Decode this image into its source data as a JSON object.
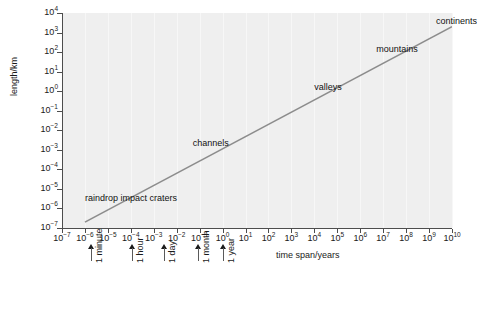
{
  "chart_data": {
    "type": "line",
    "title": "",
    "xlabel": "time span/years",
    "ylabel": "length/km",
    "xscale": "log",
    "yscale": "log",
    "xlim": [
      1e-07,
      10000000000.0
    ],
    "ylim": [
      1e-07,
      10000.0
    ],
    "grid": true,
    "legend": "none",
    "x_tick_labels": [
      "10-7",
      "10-6",
      "10-5",
      "10-4",
      "10-3",
      "10-2",
      "10-1",
      "100",
      "101",
      "102",
      "103",
      "104",
      "105",
      "106",
      "107",
      "108",
      "109",
      "1010"
    ],
    "x_tick_exponents": [
      -7,
      -6,
      -5,
      -4,
      -3,
      -2,
      -1,
      0,
      1,
      2,
      3,
      4,
      5,
      6,
      7,
      8,
      9,
      10
    ],
    "y_tick_exponents": [
      4,
      3,
      2,
      1,
      0,
      -1,
      -2,
      -3,
      -4,
      -5,
      -6,
      -7
    ],
    "series": [
      {
        "name": "landform scaling trend",
        "color": "#8c8c8c",
        "points": [
          {
            "x": 1e-06,
            "y": 2e-07
          },
          {
            "x": 10000000000.0,
            "y": 2000.0
          }
        ]
      }
    ],
    "annotations": [
      {
        "label": "raindrop impact craters",
        "x": 1e-06,
        "y": 3e-06
      },
      {
        "label": "channels",
        "x": 0.05,
        "y": 0.002
      },
      {
        "label": "valleys",
        "x": 10000.0,
        "y": 1.5
      },
      {
        "label": "mountains",
        "x": 5000000.0,
        "y": 130.0
      },
      {
        "label": "continents",
        "x": 2000000000.0,
        "y": 3500.0
      }
    ],
    "time_markers": [
      {
        "label": "1 minute",
        "x": 1.9e-06
      },
      {
        "label": "1 hour",
        "x": 0.000114
      },
      {
        "label": "1 day",
        "x": 0.00274
      },
      {
        "label": "1 month",
        "x": 0.083
      },
      {
        "label": "1 year",
        "x": 1.0
      }
    ]
  },
  "colors": {
    "panel_background": "#efefef",
    "page_background": "#ffffff",
    "axis": "#4d4d4d",
    "gridline": "#f7f7f7",
    "series": "#8c8c8c",
    "text": "#1a1a1a"
  }
}
